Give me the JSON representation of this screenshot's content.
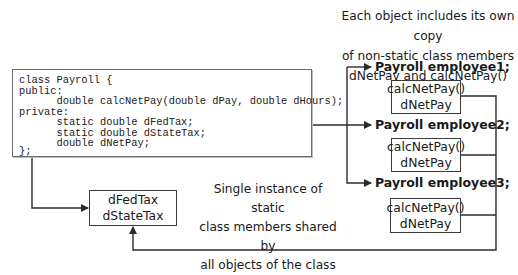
{
  "code": {
    "lines": [
      "class Payroll {",
      "public:",
      "      double calcNetPay(double dPay, double dHours);",
      "private:",
      "      static double dFedTax;",
      "      static double dStateTax;",
      "      double dNetPay;",
      "};"
    ]
  },
  "top_caption": {
    "lines": [
      "Each object includes its own copy",
      "of non-static class members",
      "dNetPay and calcNetPay()"
    ]
  },
  "objects": [
    {
      "label": "Payroll employee1;",
      "members": [
        "calcNetPay()",
        "dNetPay"
      ]
    },
    {
      "label": "Payroll employee2;",
      "members": [
        "calcNetPay()",
        "dNetPay"
      ]
    },
    {
      "label": "Payroll employee3;",
      "members": [
        "calcNetPay()",
        "dNetPay"
      ]
    }
  ],
  "static_box": {
    "members": [
      "dFedTax",
      "dStateTax"
    ]
  },
  "static_caption": {
    "lines": [
      "Single instance of static",
      "class members shared by",
      "all objects of the class"
    ]
  },
  "colors": {
    "line": "#2b2b2b",
    "box_border": "#3a3a3a",
    "code_border": "#6b6b6b"
  }
}
